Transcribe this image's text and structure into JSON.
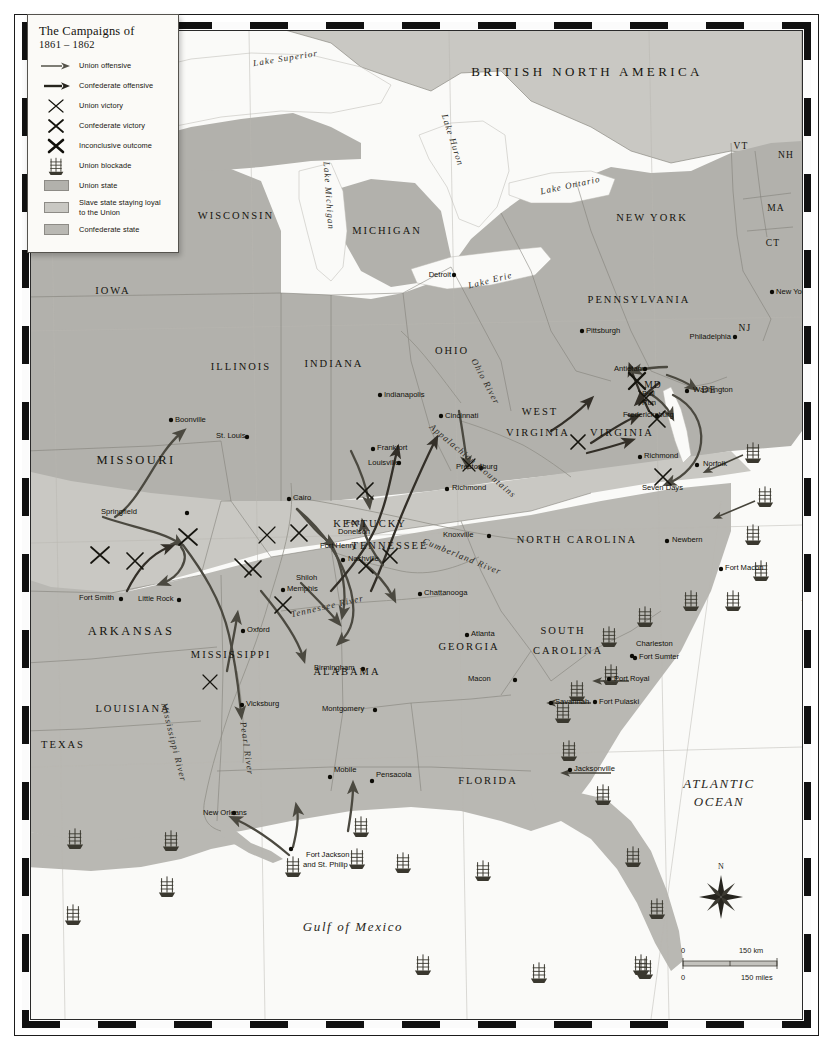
{
  "legend": {
    "title": "The Campaigns of",
    "subtitle": "1861 – 1862",
    "items": [
      {
        "symbol": "union-offensive-arrow",
        "label": "Union offensive"
      },
      {
        "symbol": "confederate-offensive-arrow",
        "label": "Confederate offensive"
      },
      {
        "symbol": "union-victory-cross",
        "label": "Union victory"
      },
      {
        "symbol": "confederate-victory-cross",
        "label": "Confederate victory"
      },
      {
        "symbol": "inconclusive-cross",
        "label": "Inconclusive outcome"
      },
      {
        "symbol": "blockade-ship",
        "label": "Union blockade"
      },
      {
        "symbol": "swatch-union",
        "label": "Union state"
      },
      {
        "symbol": "swatch-border",
        "label": "Slave state staying loyal to the Union"
      },
      {
        "symbol": "swatch-confederate",
        "label": "Confederate state"
      }
    ],
    "colors": {
      "union_state": "#b2b1ac",
      "border_state": "#c9c8c3",
      "confederate_state": "#b9b8b3",
      "water": "#fafaf8",
      "land_base": "#c2c1bc"
    }
  },
  "countries": [
    {
      "name": "BRITISH NORTH AMERICA",
      "x": 556,
      "y": 45
    }
  ],
  "oceans": [
    {
      "name": "ATLANTIC",
      "x": 688,
      "y": 757
    },
    {
      "name": "OCEAN",
      "x": 688,
      "y": 775
    },
    {
      "name": "Gulf of  Mexico",
      "x": 322,
      "y": 900
    }
  ],
  "lakes": [
    {
      "name": "Lake Superior",
      "x": 255,
      "y": 30,
      "rot": -9
    },
    {
      "name": "Lake Huron",
      "x": 419,
      "y": 110,
      "rot": 72
    },
    {
      "name": "Lake Michigan",
      "x": 295,
      "y": 165,
      "rot": 86
    },
    {
      "name": "Lake Ontario",
      "x": 540,
      "y": 157,
      "rot": -12
    },
    {
      "name": "Lake Erie",
      "x": 460,
      "y": 252,
      "rot": -14
    }
  ],
  "rivers": [
    {
      "name": "Ohio River",
      "x": 452,
      "y": 352,
      "rot": 62
    },
    {
      "name": "Cumberland River",
      "x": 430,
      "y": 528,
      "rot": 22
    },
    {
      "name": "Tennessee River",
      "x": 297,
      "y": 578,
      "rot": -13
    },
    {
      "name": "Mississippi River",
      "x": 140,
      "y": 712,
      "rot": 76
    },
    {
      "name": "Pearl River",
      "x": 213,
      "y": 718,
      "rot": 82
    },
    {
      "name": "Appalachian Mountains",
      "x": 440,
      "y": 432,
      "rot": 40
    }
  ],
  "states": [
    {
      "name": "WISCONSIN",
      "x": 205,
      "y": 188,
      "size": "med"
    },
    {
      "name": "MICHIGAN",
      "x": 356,
      "y": 203,
      "size": "med"
    },
    {
      "name": "NEW YORK",
      "x": 621,
      "y": 190,
      "size": "med"
    },
    {
      "name": "VT",
      "x": 710,
      "y": 118,
      "size": "small"
    },
    {
      "name": "NH",
      "x": 755,
      "y": 127,
      "size": "small"
    },
    {
      "name": "MA",
      "x": 745,
      "y": 180,
      "size": "small"
    },
    {
      "name": "CT",
      "x": 742,
      "y": 215,
      "size": "small"
    },
    {
      "name": "IOWA",
      "x": 82,
      "y": 263,
      "size": "med"
    },
    {
      "name": "PENNSYLVANIA",
      "x": 608,
      "y": 272,
      "size": "med"
    },
    {
      "name": "NJ",
      "x": 714,
      "y": 300,
      "size": "small"
    },
    {
      "name": "ILLINOIS",
      "x": 210,
      "y": 339,
      "size": "med"
    },
    {
      "name": "INDIANA",
      "x": 303,
      "y": 336,
      "size": "med"
    },
    {
      "name": "OHIO",
      "x": 421,
      "y": 323,
      "size": "med"
    },
    {
      "name": "MD",
      "x": 622,
      "y": 357,
      "size": "small"
    },
    {
      "name": "DE",
      "x": 678,
      "y": 362,
      "size": "small"
    },
    {
      "name": "WEST",
      "x": 509,
      "y": 384,
      "size": "med"
    },
    {
      "name": "VIRGINIA",
      "x": 507,
      "y": 405,
      "size": "med"
    },
    {
      "name": "VIRGINIA",
      "x": 591,
      "y": 405,
      "size": "med"
    },
    {
      "name": "MISSOURI",
      "x": 105,
      "y": 433,
      "size": "big"
    },
    {
      "name": "KENTUCKY",
      "x": 339,
      "y": 496,
      "size": "med"
    },
    {
      "name": "TENNESSEE",
      "x": 359,
      "y": 518,
      "size": "med"
    },
    {
      "name": "NORTH CAROLINA",
      "x": 546,
      "y": 512,
      "size": "med"
    },
    {
      "name": "ARKANSAS",
      "x": 100,
      "y": 604,
      "size": "big"
    },
    {
      "name": "SOUTH",
      "x": 532,
      "y": 603,
      "size": "med"
    },
    {
      "name": "CAROLINA",
      "x": 537,
      "y": 623,
      "size": "med"
    },
    {
      "name": "MISSISSIPPI",
      "x": 200,
      "y": 627,
      "size": "med"
    },
    {
      "name": "ALABAMA",
      "x": 316,
      "y": 644,
      "size": "med"
    },
    {
      "name": "GEORGIA",
      "x": 438,
      "y": 619,
      "size": "med"
    },
    {
      "name": "LOUISIANA",
      "x": 102,
      "y": 681,
      "size": "med"
    },
    {
      "name": "TEXAS",
      "x": 32,
      "y": 717,
      "size": "med"
    },
    {
      "name": "FLORIDA",
      "x": 457,
      "y": 753,
      "size": "med"
    }
  ],
  "cities": [
    {
      "name": "Detroit",
      "x": 420,
      "y": 246,
      "anchor": "end"
    },
    {
      "name": "New York",
      "x": 745,
      "y": 263,
      "anchor": "start"
    },
    {
      "name": "Pittsburgh",
      "x": 555,
      "y": 302,
      "anchor": "start"
    },
    {
      "name": "Philadelphia",
      "x": 700,
      "y": 308,
      "anchor": "end"
    },
    {
      "name": "Indianapolis",
      "x": 353,
      "y": 366,
      "anchor": "start"
    },
    {
      "name": "Cincinnati",
      "x": 414,
      "y": 387,
      "anchor": "start"
    },
    {
      "name": "Boonville",
      "x": 144,
      "y": 391,
      "anchor": "start"
    },
    {
      "name": "St. Louis",
      "x": 185,
      "y": 407,
      "anchor": "start"
    },
    {
      "name": "Frankfort",
      "x": 346,
      "y": 419,
      "anchor": "start"
    },
    {
      "name": "Louisville",
      "x": 337,
      "y": 434,
      "anchor": "start"
    },
    {
      "name": "Prestonburg",
      "x": 425,
      "y": 438,
      "anchor": "start"
    },
    {
      "name": "Richmond",
      "x": 421,
      "y": 459,
      "anchor": "start"
    },
    {
      "name": "Richmond",
      "x": 613,
      "y": 427,
      "anchor": "start"
    },
    {
      "name": "Norfolk",
      "x": 672,
      "y": 435,
      "anchor": "start"
    },
    {
      "name": "Washington",
      "x": 662,
      "y": 361,
      "anchor": "start"
    },
    {
      "name": "Antietam",
      "x": 583,
      "y": 340,
      "anchor": "start"
    },
    {
      "name": "Fredericksburg",
      "x": 592,
      "y": 386,
      "anchor": "start"
    },
    {
      "name": "Springfield",
      "x": 70,
      "y": 483,
      "anchor": "start"
    },
    {
      "name": "Cairo",
      "x": 262,
      "y": 469,
      "anchor": "start"
    },
    {
      "name": "Knoxville",
      "x": 412,
      "y": 506,
      "anchor": "start"
    },
    {
      "name": "Nashville",
      "x": 317,
      "y": 530,
      "anchor": "start"
    },
    {
      "name": "Newbern",
      "x": 641,
      "y": 511,
      "anchor": "start"
    },
    {
      "name": "Fort Macon",
      "x": 694,
      "y": 539,
      "anchor": "start"
    },
    {
      "name": "Memphis",
      "x": 256,
      "y": 560,
      "anchor": "start"
    },
    {
      "name": "Chattanooga",
      "x": 393,
      "y": 564,
      "anchor": "start"
    },
    {
      "name": "Fort Smith",
      "x": 48,
      "y": 569,
      "anchor": "start"
    },
    {
      "name": "Little Rock",
      "x": 107,
      "y": 570,
      "anchor": "start"
    },
    {
      "name": "Oxford",
      "x": 216,
      "y": 601,
      "anchor": "start"
    },
    {
      "name": "Atlanta",
      "x": 440,
      "y": 605,
      "anchor": "start"
    },
    {
      "name": "Birmingham",
      "x": 283,
      "y": 639,
      "anchor": "start"
    },
    {
      "name": "Charleston",
      "x": 605,
      "y": 615,
      "anchor": "start"
    },
    {
      "name": "Fort Sumter",
      "x": 608,
      "y": 628,
      "anchor": "start"
    },
    {
      "name": "Macon",
      "x": 437,
      "y": 650,
      "anchor": "start"
    },
    {
      "name": "Port Royal",
      "x": 583,
      "y": 650,
      "anchor": "start"
    },
    {
      "name": "Savannah",
      "x": 524,
      "y": 673,
      "anchor": "start"
    },
    {
      "name": "Fort Pulaski",
      "x": 568,
      "y": 673,
      "anchor": "start"
    },
    {
      "name": "Vicksburg",
      "x": 215,
      "y": 675,
      "anchor": "start"
    },
    {
      "name": "Montgomery",
      "x": 291,
      "y": 680,
      "anchor": "start"
    },
    {
      "name": "Jacksonville",
      "x": 543,
      "y": 740,
      "anchor": "start"
    },
    {
      "name": "Mobile",
      "x": 303,
      "y": 741,
      "anchor": "start"
    },
    {
      "name": "Pensacola",
      "x": 345,
      "y": 746,
      "anchor": "start"
    },
    {
      "name": "New Orleans",
      "x": 172,
      "y": 784,
      "anchor": "start"
    }
  ],
  "battles": [
    {
      "name": "Bull",
      "x": 611,
      "y": 365
    },
    {
      "name": "Run",
      "x": 611,
      "y": 374
    },
    {
      "name": "Seven Days",
      "x": 611,
      "y": 459
    },
    {
      "name": "Fort",
      "x": 315,
      "y": 494
    },
    {
      "name": "Donelson",
      "x": 307,
      "y": 503
    },
    {
      "name": "Fort Henry",
      "x": 289,
      "y": 517
    },
    {
      "name": "Shiloh",
      "x": 265,
      "y": 549
    },
    {
      "name": "Fort Jackson",
      "x": 275,
      "y": 826
    },
    {
      "name": "and St. Philip",
      "x": 272,
      "y": 836
    }
  ],
  "graticule": {
    "longitude": [
      {
        "label": "95°",
        "x": 48,
        "y": 999
      },
      {
        "label": "90°",
        "x": 246,
        "y": 999
      },
      {
        "label": "85°",
        "x": 447,
        "y": 999
      },
      {
        "label": "80°",
        "x": 650,
        "y": 998
      }
    ],
    "latitude": [
      {
        "label": "40°",
        "x": 779,
        "y": 317
      },
      {
        "label": "35°",
        "x": 779,
        "y": 525
      },
      {
        "label": "30°",
        "x": 779,
        "y": 752
      },
      {
        "label": "75°",
        "x": 770,
        "y": 574
      }
    ]
  },
  "scale": {
    "top_zero": "0",
    "top_value": "150 km",
    "bottom_zero": "0",
    "bottom_value": "150 miles"
  },
  "compass": {
    "north": "N"
  }
}
